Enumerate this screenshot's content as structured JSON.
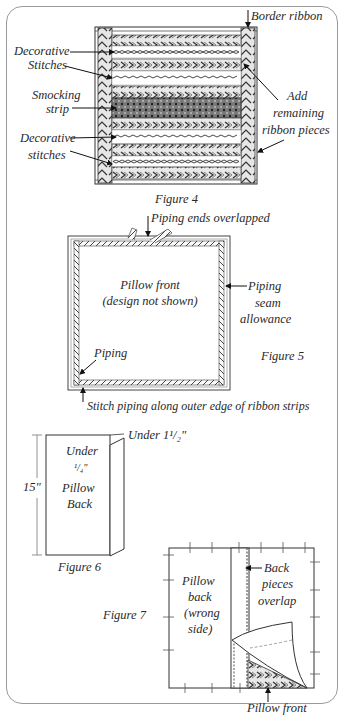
{
  "figure4": {
    "caption": "Figure 4",
    "labels": {
      "border_ribbon": "Border ribbon",
      "decorative_stitches_top_1": "Decorative",
      "decorative_stitches_top_2": "Stitches",
      "smocking_strip_1": "Smocking",
      "smocking_strip_2": "strip",
      "decorative_stitches_bottom_1": "Decorative",
      "decorative_stitches_bottom_2": "stitches",
      "add_remaining_1": "Add",
      "add_remaining_2": "remaining",
      "add_remaining_3": "ribbon pieces"
    }
  },
  "figure5": {
    "caption": "Figure 5",
    "labels": {
      "piping_ends": "Piping ends overlapped",
      "pillow_front_1": "Pillow front",
      "pillow_front_2": "(design not shown)",
      "piping_seam_1": "Piping",
      "piping_seam_2": "seam",
      "piping_seam_3": "allowance",
      "piping": "Piping",
      "stitch_piping": "Stitch piping along outer edge of ribbon strips"
    }
  },
  "figure6": {
    "caption": "Figure 6",
    "labels": {
      "under_1_5": "Under 1¹/₂\"",
      "under_1": "Under",
      "under_2": "¹/₄\"",
      "height": "15\"",
      "pillow_back_1": "Pillow",
      "pillow_back_2": "Back"
    }
  },
  "figure7": {
    "caption": "Figure 7",
    "labels": {
      "pillow_back_1": "Pillow",
      "pillow_back_2": "back",
      "pillow_back_3": "(wrong",
      "pillow_back_4": "side)",
      "back_pieces_1": "Back",
      "back_pieces_2": "pieces",
      "back_pieces_3": "overlap",
      "pillow_front": "Pillow front"
    }
  },
  "footer": {
    "cut_text": "Bottom of page text (cut off)"
  }
}
